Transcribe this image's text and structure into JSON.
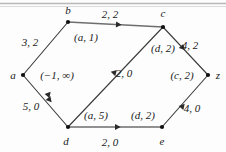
{
  "figure": {
    "type": "flow-network-diagram",
    "background": "#fdfdfd",
    "line_color": "#3a3a3a",
    "text_color": "#1a1a1a",
    "top_rule_color": "#b8b8b8"
  },
  "nodes": [
    {
      "id": "a",
      "label": "a",
      "x": 23,
      "y": 75,
      "label_x": 13,
      "label_y": 75
    },
    {
      "id": "b",
      "label": "b",
      "x": 68,
      "y": 22,
      "label_x": 68,
      "label_y": 10
    },
    {
      "id": "c",
      "label": "c",
      "x": 163,
      "y": 27,
      "label_x": 163,
      "label_y": 13
    },
    {
      "id": "d",
      "label": "d",
      "x": 68,
      "y": 127,
      "label_x": 66,
      "label_y": 141
    },
    {
      "id": "e",
      "label": "e",
      "x": 162,
      "y": 127,
      "label_x": 162,
      "label_y": 141
    },
    {
      "id": "z",
      "label": "z",
      "x": 208,
      "y": 75,
      "label_x": 218,
      "label_y": 75
    }
  ],
  "edges": [
    {
      "id": "a-b",
      "from": "a",
      "to": "b",
      "weight": "3, 2",
      "weight_x": 30,
      "weight_y": 42
    },
    {
      "id": "b-c",
      "from": "b",
      "to": "c",
      "weight": "2, 2",
      "weight_x": 110,
      "weight_y": 14
    },
    {
      "id": "c-z",
      "from": "c",
      "to": "z",
      "weight": "4, 2",
      "weight_x": 190,
      "weight_y": 45
    },
    {
      "id": "a-d",
      "from": "a",
      "to": "d",
      "weight": "5, 0",
      "weight_x": 31,
      "weight_y": 106
    },
    {
      "id": "d-e",
      "from": "d",
      "to": "e",
      "weight": "2, 0",
      "weight_x": 110,
      "weight_y": 142
    },
    {
      "id": "e-z",
      "from": "e",
      "to": "z",
      "weight": "4, 0",
      "weight_x": 192,
      "weight_y": 108
    },
    {
      "id": "d-c",
      "from": "d",
      "to": "c",
      "weight": "2, 0",
      "weight_x": 124,
      "weight_y": 73
    }
  ],
  "annotations": [
    {
      "id": "label-b",
      "text": "(a, 1)",
      "x": 86,
      "y": 37
    },
    {
      "id": "label-a",
      "text": "(−1, ∞)",
      "x": 57,
      "y": 75
    },
    {
      "id": "label-c",
      "text": "(d, 2)",
      "x": 163,
      "y": 48
    },
    {
      "id": "label-z",
      "text": "(c, 2)",
      "x": 182,
      "y": 75
    },
    {
      "id": "label-d",
      "text": "(a, 5)",
      "x": 96,
      "y": 115
    },
    {
      "id": "label-e",
      "text": "(d, 2)",
      "x": 143,
      "y": 115
    }
  ]
}
